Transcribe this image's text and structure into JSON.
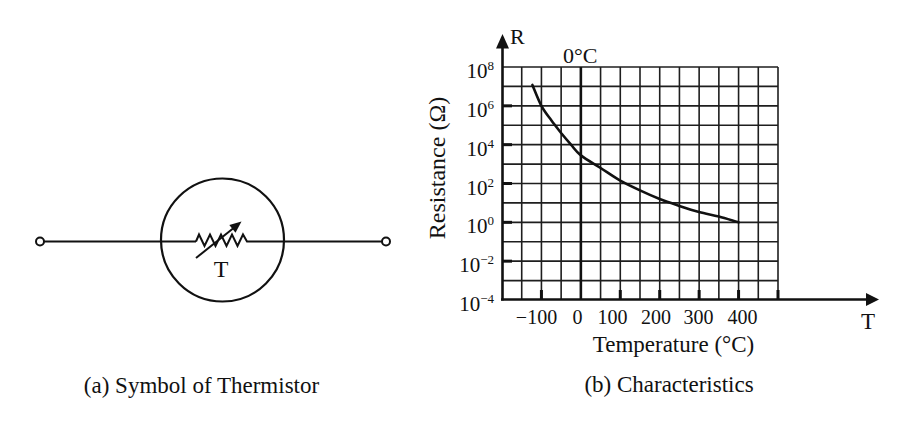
{
  "panel_a": {
    "caption": "(a) Symbol of Thermistor",
    "symbol_text": "T"
  },
  "panel_b": {
    "caption": "(b) Characteristics"
  },
  "chart_data": {
    "type": "line",
    "title": "(b) Characteristics",
    "xlabel": "Temperature (°C)",
    "ylabel": "Resistance (Ω)",
    "x_axis_symbol": "T",
    "y_axis_symbol": "R",
    "xscale": "linear",
    "yscale": "log",
    "xlim": [
      -200,
      500
    ],
    "ylim": [
      0.0001,
      100000000
    ],
    "grid": true,
    "grid_x_step": 50,
    "grid_y_step_decades": 1,
    "legend": null,
    "x_ticks": [
      -100,
      0,
      100,
      200,
      300,
      400
    ],
    "x_tick_labels": [
      "−100",
      "0",
      "100",
      "200",
      "300",
      "400"
    ],
    "x_tick_marks": [
      -100,
      100,
      200,
      300,
      400,
      500
    ],
    "y_ticks": [
      100000000,
      1000000,
      10000,
      100,
      1,
      0.01,
      0.0001
    ],
    "y_tick_labels": [
      {
        "base": "10",
        "exp": "8"
      },
      {
        "base": "10",
        "exp": "6"
      },
      {
        "base": "10",
        "exp": "4"
      },
      {
        "base": "10",
        "exp": "2"
      },
      {
        "base": "10",
        "exp": "0"
      },
      {
        "base": "10",
        "exp": "−2"
      },
      {
        "base": "10",
        "exp": "−4"
      }
    ],
    "y_tick_marks": [
      1000000,
      10000,
      100,
      1,
      0.01
    ],
    "annotations": [
      {
        "text": "0°C",
        "x": 0
      }
    ],
    "series": [
      {
        "name": "Resistance (Ω)",
        "x": [
          -123,
          -100,
          -75,
          -50,
          -25,
          0,
          50,
          100,
          150,
          200,
          250,
          300,
          350,
          400
        ],
        "y": [
          12000000,
          1000000,
          180000,
          40000,
          10000,
          2800,
          630,
          140,
          44,
          16,
          7,
          3.4,
          2,
          1
        ]
      }
    ]
  }
}
